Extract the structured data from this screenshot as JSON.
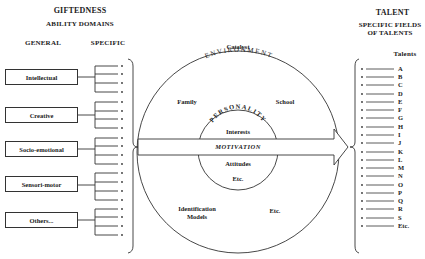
{
  "left": {
    "title": "GIFTEDNESS",
    "subtitle": "ABILITY DOMAINS",
    "col_general": "GENERAL",
    "col_specific": "SPECIFIC",
    "domains": [
      {
        "label": "Intellectual"
      },
      {
        "label": "Creative"
      },
      {
        "label": "Socio-emotional"
      },
      {
        "label": "Sensori-motor"
      },
      {
        "label": "Others..."
      }
    ]
  },
  "center": {
    "catalyst": "Catalyst",
    "environment": "ENVIRONMENT",
    "family": "Family",
    "school": "School",
    "personality": "PERSONALITY",
    "interests": "Interests",
    "motivation": "MOTIVATION",
    "attitudes": "Attitudes",
    "etc_inner": "Etc.",
    "identification": "Identification",
    "models": "Models",
    "etc_outer": "Etc."
  },
  "right": {
    "title": "TALENT",
    "subtitle_line1": "SPECIFIC FIELDS",
    "subtitle_line2": "OF TALENTS",
    "talents_header": "Talents",
    "talents": [
      "A",
      "B",
      "C",
      "D",
      "E",
      "F",
      "G",
      "H",
      "I",
      "J",
      "K",
      "L",
      "M",
      "N",
      "O",
      "P",
      "Q",
      "R",
      "S",
      "Etc."
    ]
  },
  "colors": {
    "ink": "#222222",
    "background": "#ffffff"
  }
}
